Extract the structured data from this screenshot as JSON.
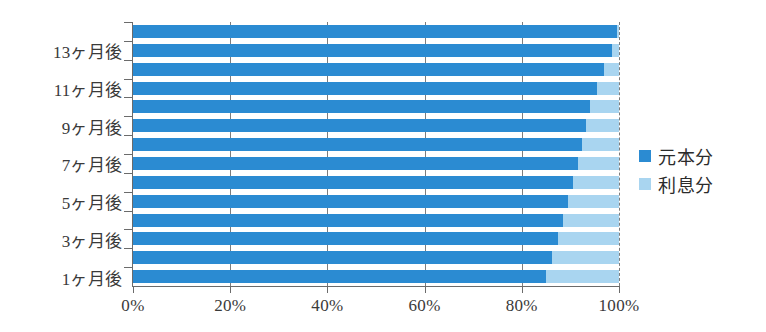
{
  "chart_data": {
    "type": "bar",
    "orientation": "horizontal",
    "stacked": true,
    "stack_total": 100,
    "title": "",
    "xlabel": "",
    "ylabel": "",
    "xlim": [
      0,
      100
    ],
    "xticks": [
      0,
      20,
      40,
      60,
      80,
      100
    ],
    "xtick_labels": [
      "0%",
      "20%",
      "40%",
      "60%",
      "80%",
      "100%"
    ],
    "grid": true,
    "grid_axis": "x",
    "legend_position": "right",
    "categories": [
      "1ヶ月後",
      "2ヶ月後",
      "3ヶ月後",
      "4ヶ月後",
      "5ヶ月後",
      "6ヶ月後",
      "7ヶ月後",
      "8ヶ月後",
      "9ヶ月後",
      "10ヶ月後",
      "11ヶ月後",
      "12ヶ月後",
      "13ヶ月後",
      "14ヶ月後"
    ],
    "visible_ytick_labels": [
      "1ヶ月後",
      "3ヶ月後",
      "5ヶ月後",
      "7ヶ月後",
      "9ヶ月後",
      "11ヶ月後",
      "13ヶ月後"
    ],
    "series": [
      {
        "name": "元本分",
        "color": "#2b8bd2",
        "values": [
          85.0,
          86.2,
          87.4,
          88.5,
          89.5,
          90.5,
          91.5,
          92.3,
          93.2,
          94.0,
          95.5,
          97.0,
          98.6,
          99.5
        ]
      },
      {
        "name": "利息分",
        "color": "#a9d5f0",
        "values": [
          15.0,
          13.8,
          12.6,
          11.5,
          10.5,
          9.5,
          8.5,
          7.7,
          6.8,
          6.0,
          4.5,
          3.0,
          1.4,
          0.5
        ]
      }
    ]
  },
  "legend": {
    "items": [
      {
        "label": "元本分",
        "color": "#2b8bd2"
      },
      {
        "label": "利息分",
        "color": "#a9d5f0"
      }
    ]
  },
  "colors": {
    "principal": "#2b8bd2",
    "interest": "#a9d5f0",
    "axis": "#6b6b6b",
    "grid": "#7d7d7d",
    "text": "#3a3a3a",
    "background": "#ffffff"
  }
}
